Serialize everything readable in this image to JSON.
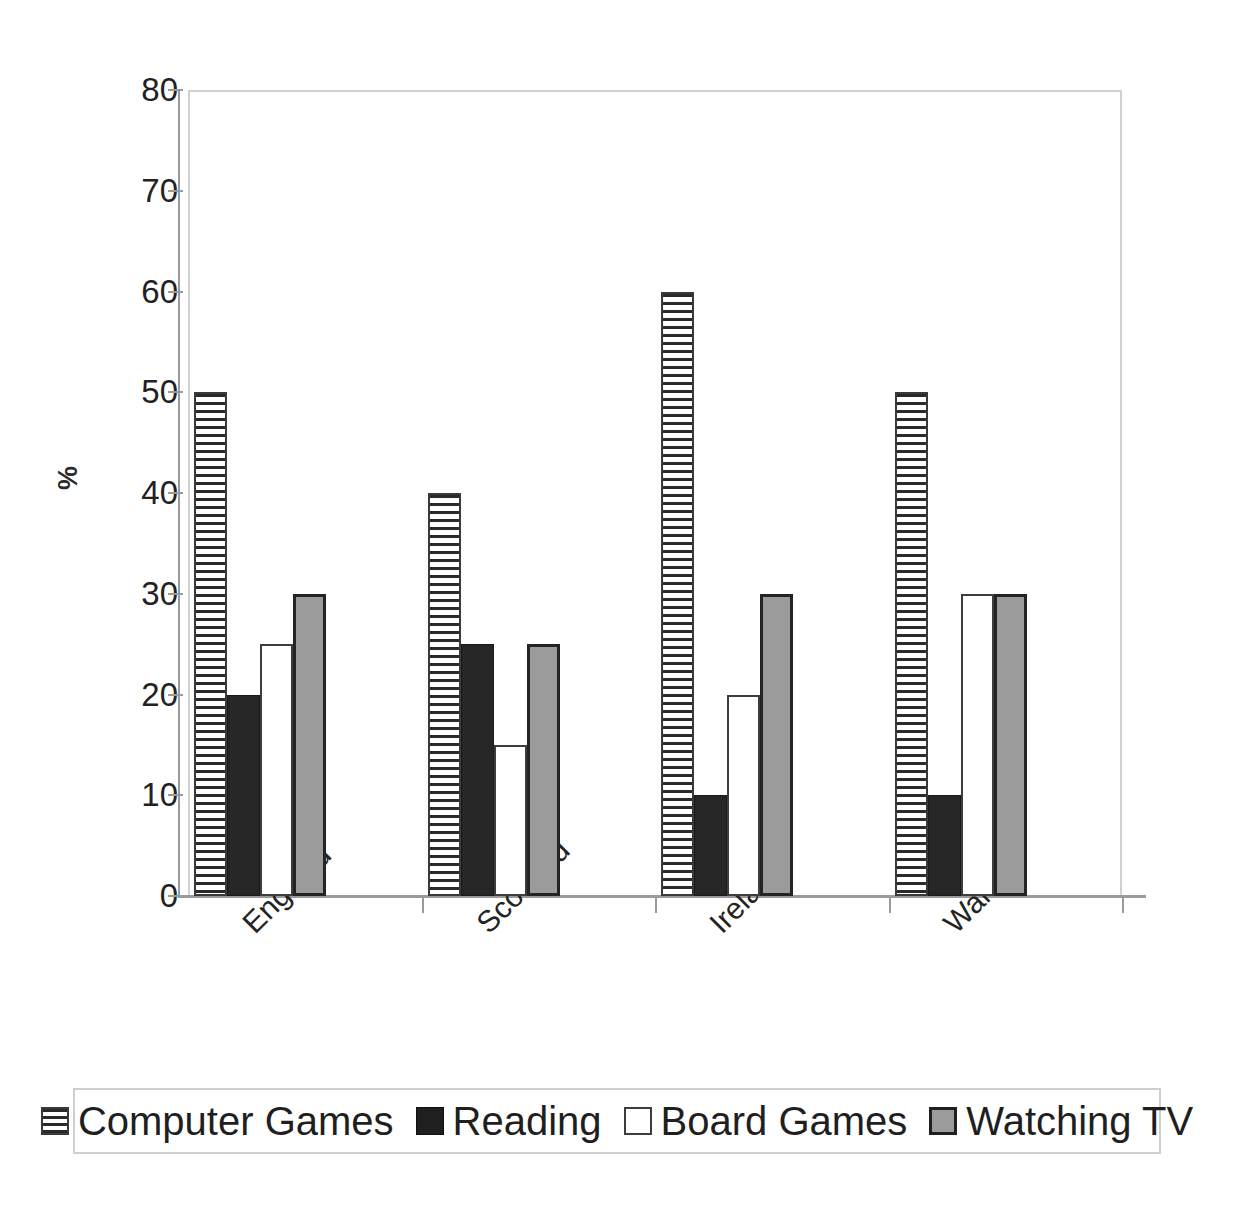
{
  "chart_data": {
    "type": "bar",
    "title": "",
    "subtitle": "",
    "xlabel": "",
    "ylabel": "%",
    "ylim": [
      0,
      80
    ],
    "ytick_labels": [
      "0",
      "10",
      "20",
      "30",
      "40",
      "50",
      "60",
      "70",
      "80"
    ],
    "ytick_values": [
      0,
      10,
      20,
      30,
      40,
      50,
      60,
      70,
      80
    ],
    "grid": false,
    "legend_position": "bottom",
    "categories": [
      "England",
      "Scotland",
      "Ireland",
      "Wales"
    ],
    "series": [
      {
        "name": "Computer Games",
        "fill": "horizontal-stripes",
        "color": "#ffffff",
        "values": [
          50,
          40,
          60,
          50
        ]
      },
      {
        "name": "Reading",
        "fill": "solid",
        "color": "#262626",
        "values": [
          20,
          25,
          10,
          10
        ]
      },
      {
        "name": "Board Games",
        "fill": "solid",
        "color": "#ffffff",
        "values": [
          25,
          15,
          20,
          30
        ]
      },
      {
        "name": "Watching TV",
        "fill": "solid",
        "color": "#9b9b9b",
        "values": [
          30,
          25,
          30,
          30
        ]
      }
    ]
  },
  "axis": {
    "y_title": "%"
  },
  "legend": {
    "entries": [
      {
        "label": "Computer Games"
      },
      {
        "label": "Reading"
      },
      {
        "label": "Board Games"
      },
      {
        "label": "Watching TV"
      }
    ]
  }
}
